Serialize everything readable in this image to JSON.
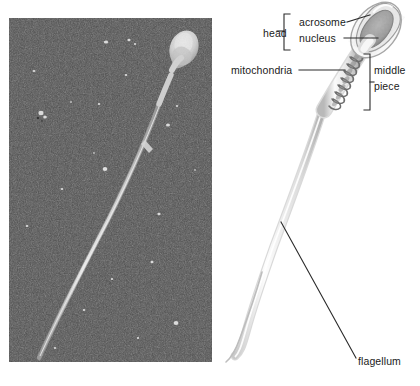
{
  "figure": {
    "type": "biology-diagram",
    "panels": [
      {
        "id": "micrograph",
        "kind": "photograph",
        "description": "scanning electron micrograph of a sperm cell on a dark gray background"
      },
      {
        "id": "schematic",
        "kind": "labeled-drawing",
        "description": "labeled line drawing of a sperm cell"
      }
    ]
  },
  "labels": {
    "head": "head",
    "acrosome": "acrosome",
    "nucleus": "nucleus",
    "mitochondria": "mitochondria",
    "middle": "middle",
    "piece": "piece",
    "flagellum": "flagellum"
  },
  "colors": {
    "photo_background": "#4d4d4d",
    "photo_cell": "#d8d8d8",
    "page_background": "#ffffff",
    "label_text": "#1a1a1a",
    "leader_line": "#2a2a2a",
    "diagram_outline": "#9a9a9a",
    "diagram_fill": "#f2f2f2",
    "nucleus_fill": "#a8a8a8",
    "mitochondria_fill": "#6e6e6e"
  }
}
